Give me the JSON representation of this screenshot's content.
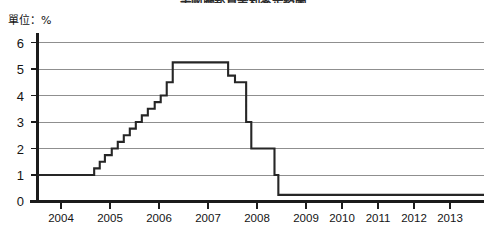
{
  "chart_title": "美國聯邦資金利率走勢圖",
  "unit_label": "單位：%",
  "axis": {
    "y_ticks": [
      "0",
      "1",
      "2",
      "3",
      "4",
      "5",
      "6"
    ],
    "x_ticks": [
      "2004",
      "2005",
      "2006",
      "2007",
      "2008",
      "2009",
      "2010",
      "2011",
      "2012",
      "2013"
    ]
  },
  "colors": {
    "line": "#262626",
    "grid": "#8f8f8f",
    "axis": "#1b1b1b",
    "background": "#ffffff"
  },
  "chart_data": {
    "type": "line",
    "title": "美國聯邦資金利率走勢圖",
    "subtitle": "",
    "xlabel": "",
    "ylabel": "單位：%",
    "ylim": [
      0,
      6
    ],
    "xlim": [
      2003.35,
      2013.75
    ],
    "grid": true,
    "legend": "none",
    "y_ticks": [
      0,
      1,
      2,
      3,
      4,
      5,
      6
    ],
    "x_ticks": [
      2004,
      2005,
      2006,
      2007,
      2008,
      2009,
      2010,
      2011,
      2012,
      2013
    ],
    "series": [
      {
        "name": "Federal funds rate",
        "step": "post",
        "x": [
          2003.35,
          2004.5,
          2004.67,
          2004.8,
          2004.92,
          2005.08,
          2005.22,
          2005.36,
          2005.5,
          2005.64,
          2005.78,
          2005.92,
          2006.08,
          2006.22,
          2006.36,
          2006.5,
          2007.62,
          2007.79,
          2007.95,
          2008.06,
          2008.21,
          2008.33,
          2008.75,
          2008.87,
          2008.96,
          2013.75
        ],
        "y": [
          1.0,
          1.0,
          1.25,
          1.5,
          1.75,
          2.0,
          2.25,
          2.5,
          2.75,
          3.0,
          3.25,
          3.5,
          3.75,
          4.0,
          4.5,
          5.25,
          5.25,
          4.75,
          4.5,
          4.5,
          3.0,
          2.0,
          2.0,
          1.0,
          0.25,
          0.25
        ]
      }
    ],
    "annotations": [
      {
        "text": "peak plateau 5.25% from mid-2006 to late-2007"
      },
      {
        "text": "floor 0.25% from late-2008 through 2013"
      }
    ]
  }
}
